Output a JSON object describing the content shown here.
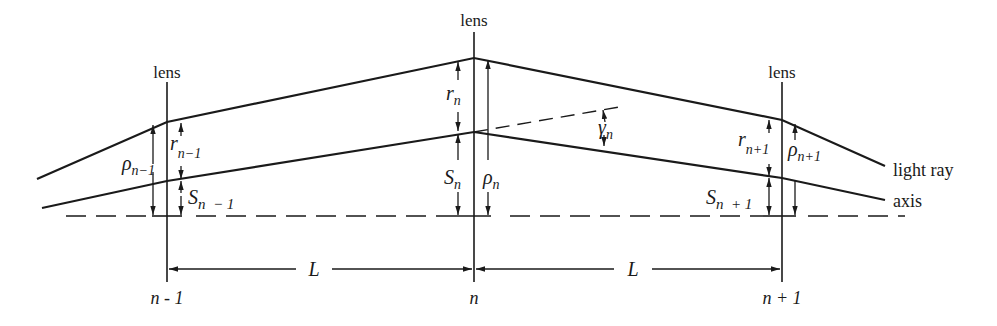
{
  "diagram": {
    "type": "thin-lens-array ray diagram",
    "stroke_color": "#1a1a1a",
    "background": "#ffffff",
    "lenses": [
      {
        "id": "n-1",
        "label": "lens",
        "index_label": "n - 1",
        "r": "r",
        "r_sub": "n−1",
        "rho": "ρ",
        "rho_sub": "n−1",
        "S": "S",
        "S_sub": "n  − 1"
      },
      {
        "id": "n",
        "label": "lens",
        "index_label": "n",
        "r": "r",
        "r_sub": "n",
        "rho": "ρ",
        "rho_sub": "n",
        "S": "S",
        "S_sub": "n",
        "gamma": "γ",
        "gamma_sub": "n"
      },
      {
        "id": "n+1",
        "label": "lens",
        "index_label": "n + 1",
        "r": "r",
        "r_sub": "n+1",
        "rho": "ρ",
        "rho_sub": "n+1",
        "S": "S",
        "S_sub": "n  + 1"
      }
    ],
    "spacing": [
      {
        "label": "L"
      },
      {
        "label": "L"
      }
    ],
    "curves": {
      "light_ray": "light ray",
      "axis": "axis"
    }
  }
}
